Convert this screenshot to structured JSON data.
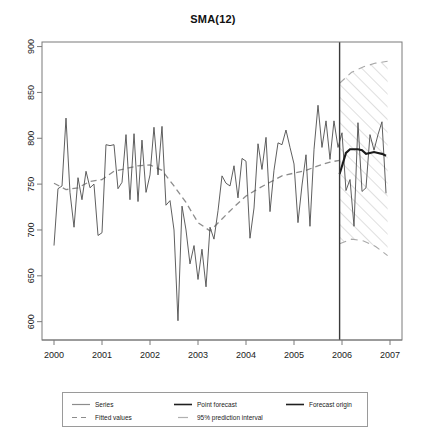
{
  "chart_data": {
    "type": "line",
    "title": "SMA(12)",
    "xlabel": "",
    "ylabel": "",
    "xlim": [
      1999.75,
      2007.25
    ],
    "ylim": [
      580,
      905
    ],
    "xticks": [
      "2000",
      "2001",
      "2002",
      "2003",
      "2004",
      "2005",
      "2006",
      "2007"
    ],
    "xtick_values": [
      2000,
      2001,
      2002,
      2003,
      2004,
      2005,
      2006,
      2007
    ],
    "yticks": [
      "600",
      "650",
      "700",
      "750",
      "800",
      "850",
      "900"
    ],
    "ytick_values": [
      600,
      650,
      700,
      750,
      800,
      850,
      900
    ],
    "grid": false,
    "legend_position": "below-plot",
    "forecast_origin": 2005.95,
    "series": [
      {
        "name": "Series",
        "style": "solid",
        "color": "#4d4d4d",
        "x": [
          2000.0,
          2000.083,
          2000.167,
          2000.25,
          2000.333,
          2000.417,
          2000.5,
          2000.583,
          2000.667,
          2000.75,
          2000.833,
          2000.917,
          2001.0,
          2001.083,
          2001.167,
          2001.25,
          2001.333,
          2001.417,
          2001.5,
          2001.583,
          2001.667,
          2001.75,
          2001.833,
          2001.917,
          2002.0,
          2002.083,
          2002.167,
          2002.25,
          2002.333,
          2002.417,
          2002.5,
          2002.583,
          2002.667,
          2002.75,
          2002.833,
          2002.917,
          2003.0,
          2003.083,
          2003.167,
          2003.25,
          2003.333,
          2003.417,
          2003.5,
          2003.583,
          2003.667,
          2003.75,
          2003.833,
          2003.917,
          2004.0,
          2004.083,
          2004.167,
          2004.25,
          2004.333,
          2004.417,
          2004.5,
          2004.583,
          2004.667,
          2004.75,
          2004.833,
          2004.917,
          2005.0,
          2005.083,
          2005.167,
          2005.25,
          2005.333,
          2005.417,
          2005.5,
          2005.583,
          2005.667,
          2005.75,
          2005.833,
          2005.917,
          2006.0,
          2006.083,
          2006.167,
          2006.25,
          2006.333,
          2006.417,
          2006.5,
          2006.583,
          2006.667,
          2006.75,
          2006.833,
          2006.917
        ],
        "values": [
          683,
          745,
          748,
          822,
          741,
          703,
          757,
          733,
          764,
          746,
          750,
          694,
          697,
          793,
          792,
          793,
          745,
          752,
          804,
          733,
          805,
          731,
          798,
          741,
          760,
          812,
          760,
          813,
          727,
          732,
          700,
          601,
          726,
          700,
          663,
          683,
          646,
          679,
          638,
          703,
          690,
          721,
          759,
          751,
          748,
          770,
          735,
          778,
          775,
          691,
          724,
          794,
          766,
          801,
          720,
          765,
          795,
          793,
          809,
          790,
          772,
          708,
          749,
          782,
          704,
          788,
          836,
          790,
          819,
          777,
          819,
          790,
          806,
          743,
          755,
          704,
          817,
          742,
          746,
          804,
          787,
          804,
          818,
          740
        ]
      },
      {
        "name": "Fitted values",
        "style": "dashed",
        "color": "#8c8c8c",
        "x": [
          2000.0,
          2000.25,
          2000.5,
          2000.75,
          2001.0,
          2001.25,
          2001.5,
          2001.75,
          2002.0,
          2002.25,
          2002.5,
          2002.75,
          2003.0,
          2003.25,
          2003.5,
          2003.75,
          2004.0,
          2004.25,
          2004.5,
          2004.75,
          2005.0,
          2005.25,
          2005.5,
          2005.75,
          2005.95
        ],
        "values": [
          751,
          744,
          746,
          753,
          755,
          764,
          767,
          770,
          771,
          765,
          748,
          730,
          708,
          699,
          712,
          725,
          737,
          745,
          752,
          759,
          762,
          765,
          770,
          774,
          776
        ]
      },
      {
        "name": "Point forecast",
        "style": "solid-thick",
        "color": "#1a1a1a",
        "x": [
          2005.95,
          2006.083,
          2006.167,
          2006.25,
          2006.333,
          2006.417,
          2006.5,
          2006.583,
          2006.667,
          2006.75,
          2006.833,
          2006.917
        ],
        "values": [
          761,
          784,
          788,
          788,
          788,
          787,
          783,
          784,
          785,
          784,
          783,
          781
        ]
      },
      {
        "name": "95% prediction interval upper",
        "style": "dashed",
        "color": "#a8a8a8",
        "x": [
          2005.95,
          2006.2,
          2006.45,
          2006.7,
          2006.95
        ],
        "values": [
          860,
          872,
          878,
          882,
          884
        ]
      },
      {
        "name": "95% prediction interval lower",
        "style": "dashed",
        "color": "#a8a8a8",
        "x": [
          2005.95,
          2006.2,
          2006.45,
          2006.7,
          2006.95
        ],
        "values": [
          685,
          690,
          688,
          682,
          672
        ]
      }
    ],
    "prediction_band": {
      "label": "95% prediction interval",
      "fill": "hatch-diagonal",
      "hatch_color": "#b4b4b4"
    }
  },
  "legend": {
    "entries": [
      {
        "label": "Series",
        "key": "solid-line-gray"
      },
      {
        "label": "Fitted values",
        "key": "dashed-line-gray"
      },
      {
        "label": "Point forecast",
        "key": "solid-line-dark"
      },
      {
        "label": "95% prediction interval",
        "key": "hatch-line-light"
      },
      {
        "label": "Forecast origin",
        "key": "solid-line-dark"
      }
    ]
  },
  "colors": {
    "series": "#4d4d4d",
    "fitted": "#8c8c8c",
    "forecast": "#1a1a1a",
    "interval": "#a8a8a8",
    "axis": "#7a7a7a",
    "background": "#ffffff"
  }
}
